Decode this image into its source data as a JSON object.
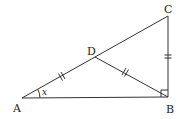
{
  "diagram": {
    "type": "right-triangle-with-median",
    "points": {
      "A": {
        "label": "A",
        "x": 22,
        "y": 98
      },
      "B": {
        "label": "B",
        "x": 168,
        "y": 97
      },
      "C": {
        "label": "C",
        "x": 168,
        "y": 16
      },
      "D": {
        "label": "D",
        "x": 95,
        "y": 57
      }
    },
    "segments": [
      "AB",
      "BC",
      "AC",
      "DB"
    ],
    "right_angle_at": "B",
    "angle_label": {
      "vertex": "A",
      "text": "x"
    },
    "tick_marks": {
      "AD": 2,
      "DB": 2,
      "BC": 2
    },
    "colors": {
      "stroke": "#333333",
      "text": "#222222",
      "background": "#ffffff"
    }
  }
}
